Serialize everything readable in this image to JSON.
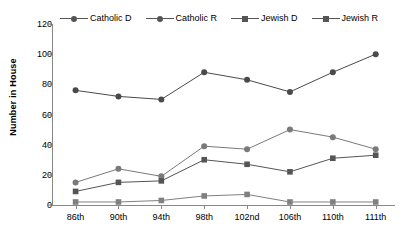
{
  "chart_data": {
    "type": "line",
    "title": "",
    "xlabel": "",
    "ylabel": "Number in House",
    "ylim": [
      0,
      120
    ],
    "yticks": [
      0,
      20,
      40,
      60,
      80,
      100,
      120
    ],
    "grid": false,
    "legend_position": "top",
    "categories": [
      "86th",
      "90th",
      "94th",
      "98th",
      "102nd",
      "106th",
      "110th",
      "111th"
    ],
    "series": [
      {
        "name": "Catholic D",
        "marker": "circle",
        "color": "#4a4a4a",
        "values": [
          76,
          72,
          70,
          88,
          83,
          75,
          88,
          100
        ]
      },
      {
        "name": "Catholic R",
        "marker": "circle",
        "color": "#7a7a7a",
        "values": [
          15,
          24,
          19,
          39,
          37,
          50,
          45,
          37
        ]
      },
      {
        "name": "Jewish D",
        "marker": "square",
        "color": "#555555",
        "values": [
          9,
          15,
          16,
          30,
          27,
          22,
          31,
          33
        ]
      },
      {
        "name": "Jewish R",
        "marker": "square",
        "color": "#808080",
        "values": [
          2,
          2,
          3,
          6,
          7,
          2,
          2,
          2
        ]
      }
    ]
  },
  "legend": {
    "items": [
      {
        "label": "Catholic D"
      },
      {
        "label": "Catholic R"
      },
      {
        "label": "Jewish D"
      },
      {
        "label": "Jewish R"
      }
    ]
  }
}
